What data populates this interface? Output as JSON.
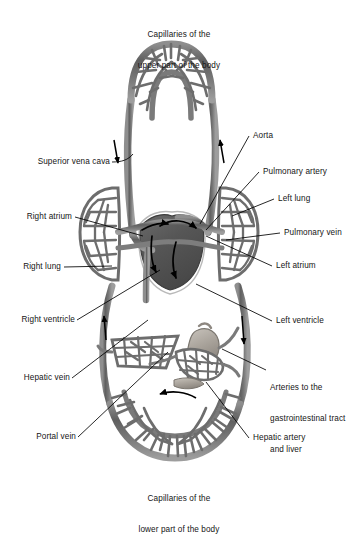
{
  "figure": {
    "type": "anatomical-diagram",
    "background_color": "#ffffff",
    "vessel_color": "#6f6f6f",
    "vessel_dark_color": "#4a4a4a",
    "heart_color": "#5c5c5c",
    "arrow_color": "#000000",
    "label_color": "#151515",
    "leader_color": "#000000"
  },
  "labels": {
    "top": {
      "line1": "Capillaries of the",
      "line2": "upper part of the body"
    },
    "bottom": {
      "line1": "Capillaries of the",
      "line2": "lower part of the body"
    },
    "left": [
      {
        "id": "superior-vena-cava",
        "text": "Superior vena cava"
      },
      {
        "id": "right-atrium",
        "text": "Right atrium"
      },
      {
        "id": "right-lung",
        "text": "Right lung"
      },
      {
        "id": "right-ventricle",
        "text": "Right ventricle"
      },
      {
        "id": "hepatic-vein",
        "text": "Hepatic vein"
      },
      {
        "id": "portal-vein",
        "text": "Portal vein"
      }
    ],
    "right": [
      {
        "id": "aorta",
        "text": "Aorta"
      },
      {
        "id": "pulmonary-artery",
        "text": "Pulmonary artery"
      },
      {
        "id": "left-lung",
        "text": "Left lung"
      },
      {
        "id": "pulmonary-vein",
        "text": "Pulmonary vein"
      },
      {
        "id": "left-atrium",
        "text": "Left atrium"
      },
      {
        "id": "left-ventricle",
        "text": "Left ventricle"
      },
      {
        "id": "hepatic-artery",
        "text": "Hepatic artery"
      }
    ],
    "gi_arteries": {
      "line1": "Arteries to the",
      "line2": "gastrointestinal tract",
      "line3": "and liver"
    }
  },
  "flow_arrows": [
    {
      "id": "upper-descending",
      "direction": "down",
      "region": "superior vena cava"
    },
    {
      "id": "upper-ascending",
      "direction": "up",
      "region": "aorta ascending branch"
    },
    {
      "id": "lower-ascending",
      "direction": "up",
      "region": "inferior vena cava"
    },
    {
      "id": "lower-descending",
      "direction": "down",
      "region": "descending aorta"
    },
    {
      "id": "lower-bed",
      "direction": "left",
      "region": "lower body capillary bed"
    }
  ]
}
